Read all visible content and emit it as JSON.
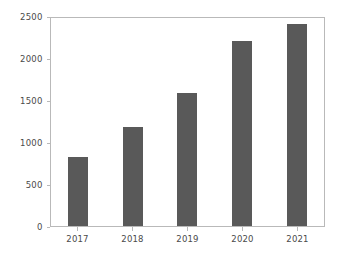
{
  "chart_data": {
    "type": "bar",
    "title": "",
    "xlabel": "",
    "ylabel": "",
    "categories": [
      "2017",
      "2018",
      "2019",
      "2020",
      "2021"
    ],
    "values": [
      820,
      1180,
      1580,
      2200,
      2400
    ],
    "ylim": [
      0,
      2500
    ],
    "yticks": [
      0,
      500,
      1000,
      1500,
      2000,
      2500
    ],
    "ytick_labels": [
      "0",
      "500",
      "1000",
      "1500",
      "2000",
      "2500"
    ],
    "grid": false,
    "legend": null,
    "bar_color": "#595959",
    "axes_color": "#b9b9b9",
    "tick_text_color": "#4a4a4a",
    "background_color": "#ffffff"
  }
}
